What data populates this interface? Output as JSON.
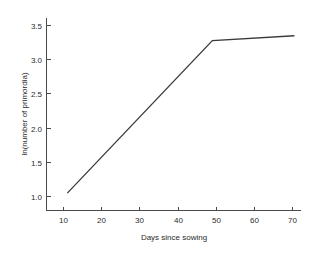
{
  "chart_data": {
    "type": "line",
    "title": "",
    "subtitle": "",
    "xlabel": "Days since sowing",
    "ylabel": "ln(number of primordia)",
    "xlim": [
      5,
      76
    ],
    "ylim": [
      0.75,
      3.72
    ],
    "xticks": [
      10,
      20,
      30,
      40,
      50,
      60,
      70
    ],
    "xtick_labels": [
      "10",
      "20",
      "30",
      "40",
      "50",
      "60",
      "70"
    ],
    "yticks": [
      1.0,
      1.5,
      2.0,
      2.5,
      3.0,
      3.5
    ],
    "ytick_labels": [
      "1.0",
      "1.5",
      "2.0",
      "2.5",
      "3.0",
      "3.5"
    ],
    "grid": false,
    "legend": false,
    "legend_position": "none",
    "line_color": "#3a3a3a",
    "axis_color": "#4a4a4a",
    "background_color": "#ffffff",
    "series": [
      {
        "name": "ln(number of primordia)",
        "x": [
          11,
          49,
          70.5
        ],
        "values": [
          1.05,
          3.28,
          3.35
        ]
      }
    ],
    "annotations": []
  },
  "axis": {
    "x_title": "Days since sowing",
    "y_title": "ln(number of primordia)"
  }
}
